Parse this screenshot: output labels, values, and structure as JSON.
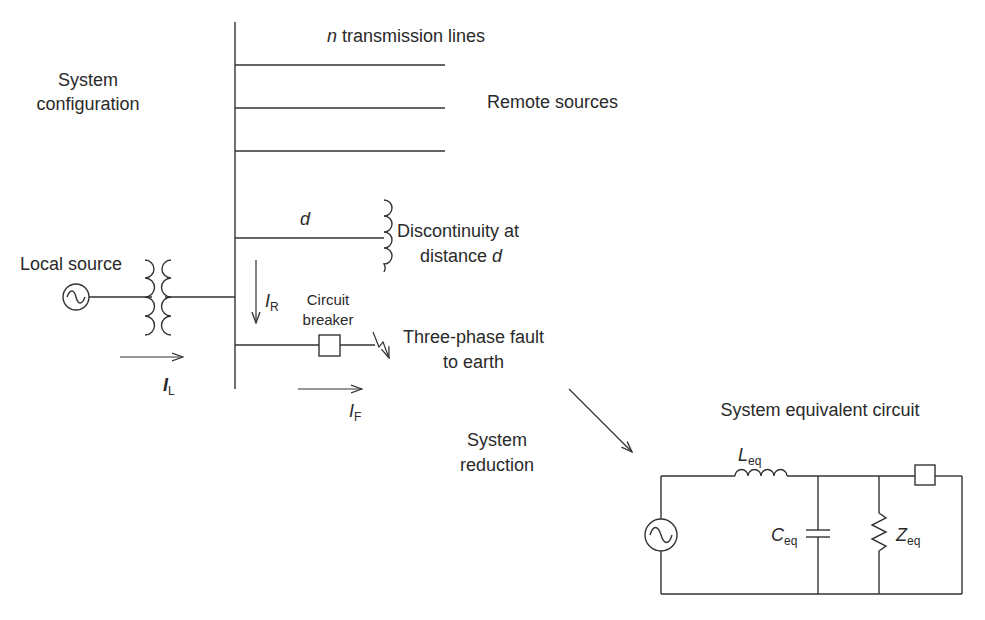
{
  "diagram": {
    "type": "electrical-single-line-diagram",
    "colors": {
      "line": "#333333",
      "text": "#2a2a2a",
      "background": "#ffffff"
    },
    "system_configuration": {
      "title_line1": "System",
      "title_line2": "configuration",
      "transmission_lines_label_var": "n",
      "transmission_lines_label_text": " transmission lines",
      "remote_sources_label": "Remote sources",
      "discontinuity_var": "d",
      "discontinuity_label_line1": "Discontinuity at",
      "discontinuity_label_line2_text": "distance ",
      "discontinuity_label_line2_var": "d",
      "local_source_label": "Local source",
      "circuit_breaker_line1": "Circuit",
      "circuit_breaker_line2": "breaker",
      "fault_label_line1": "Three-phase fault",
      "fault_label_line2": "to earth",
      "currents": {
        "IL": {
          "symbol": "I",
          "subscript": "L"
        },
        "IR": {
          "symbol": "I",
          "subscript": "R"
        },
        "IF": {
          "symbol": "I",
          "subscript": "F"
        }
      }
    },
    "reduction": {
      "label_line1": "System",
      "label_line2": "reduction"
    },
    "equivalent_circuit": {
      "title": "System equivalent circuit",
      "inductor": {
        "symbol": "L",
        "subscript": "eq"
      },
      "capacitor": {
        "symbol": "C",
        "subscript": "eq"
      },
      "impedance": {
        "symbol": "Z",
        "subscript": "eq"
      }
    }
  }
}
